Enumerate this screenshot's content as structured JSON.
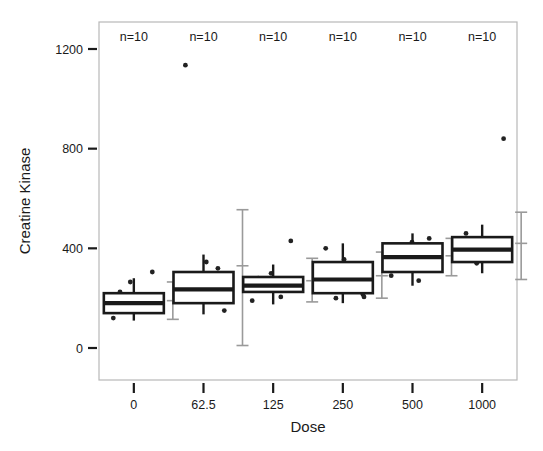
{
  "figure": {
    "width": 543,
    "height": 451,
    "background": "#ffffff",
    "foreground": "#1a1a1a",
    "errorbar_color": "#9a9a9a",
    "frame_color": "#b8b8b8"
  },
  "chart_data": {
    "type": "box",
    "title": "",
    "xlabel": "Dose",
    "ylabel": "Creatine Kinase",
    "categories": [
      "0",
      "62.5",
      "125",
      "250",
      "500",
      "1000"
    ],
    "xtick_labels": [
      "0",
      "62.5",
      "125",
      "250",
      "500",
      "1000"
    ],
    "ytick_labels": [
      "0",
      "400",
      "800",
      "1200"
    ],
    "ytick_values": [
      0,
      400,
      800,
      1200
    ],
    "ylim": [
      -40,
      1290
    ],
    "grid": false,
    "legend": null,
    "annotations": [
      {
        "text": "n=10",
        "group": "0"
      },
      {
        "text": "n=10",
        "group": "62.5"
      },
      {
        "text": "n=10",
        "group": "125"
      },
      {
        "text": "n=10",
        "group": "250"
      },
      {
        "text": "n=10",
        "group": "500"
      },
      {
        "text": "n=10",
        "group": "1000"
      }
    ],
    "annotation_text": "n=10",
    "annotation_y": 1200,
    "boxes": [
      {
        "category": "0",
        "n": 10,
        "min": 110,
        "q1": 140,
        "median": 180,
        "q3": 220,
        "max": 280,
        "whisker_low": 110,
        "whisker_high": 280,
        "points": [
          150,
          170,
          175,
          185,
          195,
          200,
          225,
          265,
          305,
          120
        ],
        "errorbar_low": 115,
        "errorbar_mean": 190,
        "errorbar_high": 265
      },
      {
        "category": "62.5",
        "n": 10,
        "min": 135,
        "q1": 180,
        "median": 235,
        "q3": 305,
        "max": 375,
        "whisker_low": 135,
        "whisker_high": 375,
        "points": [
          190,
          215,
          225,
          240,
          255,
          300,
          320,
          345,
          1135,
          150
        ],
        "errorbar_low": 10,
        "errorbar_mean": 330,
        "errorbar_high": 555
      },
      {
        "category": "125",
        "n": 10,
        "min": 175,
        "q1": 225,
        "median": 250,
        "q3": 285,
        "max": 335,
        "whisker_low": 175,
        "whisker_high": 335,
        "points": [
          205,
          230,
          240,
          250,
          255,
          270,
          280,
          300,
          430,
          190
        ],
        "errorbar_low": 185,
        "errorbar_mean": 270,
        "errorbar_high": 360
      },
      {
        "category": "250",
        "n": 10,
        "min": 180,
        "q1": 220,
        "median": 275,
        "q3": 345,
        "max": 420,
        "whisker_low": 180,
        "whisker_high": 420,
        "points": [
          200,
          215,
          250,
          265,
          290,
          310,
          330,
          355,
          400,
          205
        ],
        "errorbar_low": 200,
        "errorbar_mean": 290,
        "errorbar_high": 385
      },
      {
        "category": "500",
        "n": 10,
        "min": 250,
        "q1": 305,
        "median": 365,
        "q3": 420,
        "max": 460,
        "whisker_low": 250,
        "whisker_high": 460,
        "points": [
          270,
          320,
          340,
          355,
          370,
          395,
          410,
          425,
          440,
          290
        ],
        "errorbar_low": 290,
        "errorbar_mean": 370,
        "errorbar_high": 440
      },
      {
        "category": "1000",
        "n": 10,
        "min": 300,
        "q1": 345,
        "median": 395,
        "q3": 445,
        "max": 495,
        "whisker_low": 300,
        "whisker_high": 495,
        "points": [
          340,
          355,
          370,
          385,
          400,
          410,
          425,
          440,
          460,
          840
        ],
        "errorbar_low": 275,
        "errorbar_mean": 420,
        "errorbar_high": 545
      }
    ]
  }
}
